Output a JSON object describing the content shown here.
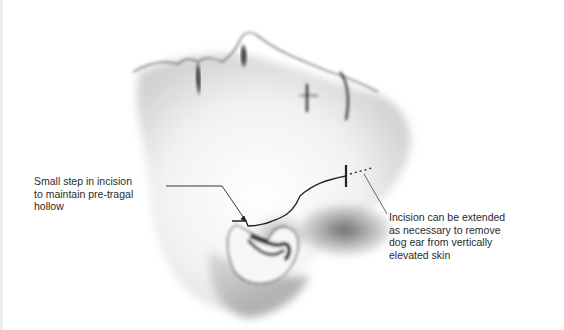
{
  "figure": {
    "annotations": [
      {
        "id": "pretragal-step",
        "lines": [
          "Small step in incision",
          "to maintain pre-tragal",
          "hollow"
        ]
      },
      {
        "id": "incision-extension",
        "lines": [
          "Incision can be extended",
          "as necessary to remove",
          "dog ear from vertically",
          "elevated skin"
        ]
      }
    ],
    "colors": {
      "background": "#ffffff",
      "ink": "#2a2a2a",
      "shading_dark": "#555555",
      "shading_mid": "#9a9a9a",
      "shading_light": "#d9d9d9"
    }
  }
}
